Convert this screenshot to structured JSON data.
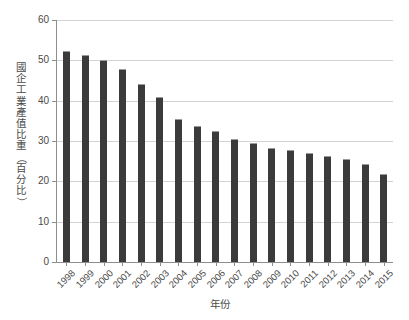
{
  "top_strip": {
    "faint_text": ""
  },
  "axis": {
    "y_title": "國企工業產值比重（百分比）",
    "y_title_chars": [
      "國",
      "企",
      "工",
      "業",
      "產",
      "值",
      "比",
      "重"
    ],
    "y_title_open_paren": "（",
    "y_title_unit_chars": [
      "百",
      "分",
      "比"
    ],
    "y_title_close_paren": "）",
    "x_title": "年份",
    "y_ticks": [
      "0",
      "10",
      "20",
      "30",
      "40",
      "50",
      "60"
    ]
  },
  "chart_data": {
    "type": "bar",
    "title": "",
    "subtitle": "",
    "xlabel": "年份",
    "ylabel": "國企工業產值比重（百分比）",
    "ylim": [
      0,
      60
    ],
    "ytick_step": 10,
    "grid": true,
    "legend": false,
    "bar_color": "#3b3b3b",
    "categories": [
      "1998",
      "1999",
      "2000",
      "2001",
      "2002",
      "2003",
      "2004",
      "2005",
      "2006",
      "2007",
      "2008",
      "2009",
      "2010",
      "2011",
      "2012",
      "2013",
      "2014",
      "2015"
    ],
    "values": [
      52.3,
      51.3,
      50.2,
      47.8,
      44.1,
      40.8,
      35.4,
      33.8,
      32.4,
      30.6,
      29.6,
      28.2,
      27.8,
      27.1,
      26.3,
      25.5,
      24.2,
      21.9
    ],
    "series": [
      {
        "name": "國企工業產值比重",
        "values": [
          52.3,
          51.3,
          50.2,
          47.8,
          44.1,
          40.8,
          35.4,
          33.8,
          32.4,
          30.6,
          29.6,
          28.2,
          27.8,
          27.1,
          26.3,
          25.5,
          24.2,
          21.9
        ]
      }
    ]
  }
}
